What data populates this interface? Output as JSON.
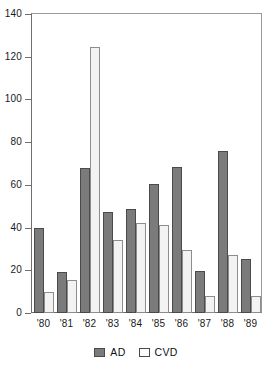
{
  "chart_data": {
    "type": "bar",
    "title": "",
    "subtitle": "",
    "xlabel": "",
    "ylabel": "",
    "categories": [
      "'80",
      "'81",
      "'82",
      "'83",
      "'84",
      "'85",
      "'86",
      "'87",
      "'88",
      "'89"
    ],
    "series": [
      {
        "name": "AD",
        "color": "#7b7b7b",
        "values": [
          40,
          19,
          68,
          47.5,
          48.5,
          60.5,
          68.5,
          19.5,
          76,
          25.5
        ]
      },
      {
        "name": "CVD",
        "color": "#f3f3f3",
        "values": [
          10,
          15.5,
          124.5,
          34,
          42,
          41,
          29.5,
          8,
          27,
          8
        ]
      }
    ],
    "ylim": [
      0,
      140
    ],
    "yticks": [
      0,
      20,
      40,
      60,
      80,
      100,
      120,
      140
    ],
    "ytick_labels": [
      "0",
      "20",
      "40",
      "60",
      "80",
      "100",
      "120",
      "140"
    ],
    "grid": false,
    "legend_position": "bottom",
    "legend": [
      "AD",
      "CVD"
    ]
  }
}
